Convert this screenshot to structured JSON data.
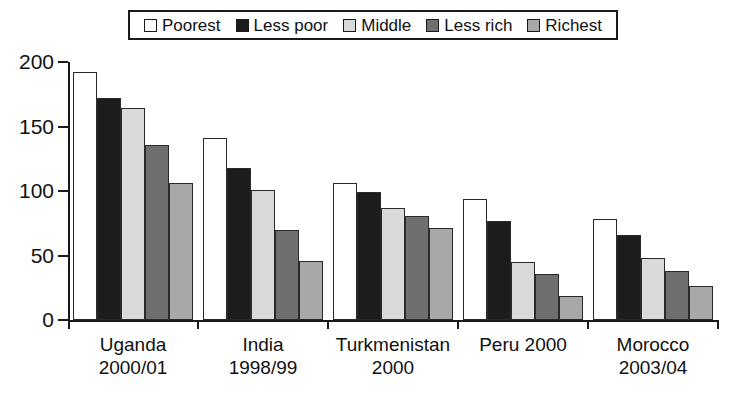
{
  "chart_data": {
    "type": "bar",
    "title": "",
    "subtitle": "",
    "xlabel": "",
    "ylabel": "",
    "ylim": [
      0,
      200
    ],
    "yticks": [
      0,
      50,
      100,
      150,
      200
    ],
    "ytick_labels": [
      "0",
      "50",
      "100",
      "150",
      "200"
    ],
    "grid": false,
    "legend_position": "top-center",
    "categories": [
      "Uganda 2000/01",
      "India 1998/99",
      "Turkmenistan 2000",
      "Peru 2000",
      "Morocco 2003/04"
    ],
    "category_lines": [
      [
        "Uganda",
        "2000/01"
      ],
      [
        "India",
        "1998/99"
      ],
      [
        "Turkmenistan",
        "2000"
      ],
      [
        "Peru 2000",
        ""
      ],
      [
        "Morocco",
        "2003/04"
      ]
    ],
    "series": [
      {
        "name": "Poorest",
        "color": "#ffffff",
        "values": [
          192,
          141,
          106,
          94,
          78
        ]
      },
      {
        "name": "Less poor",
        "color": "#1c1c1c",
        "values": [
          172,
          118,
          99,
          77,
          66
        ]
      },
      {
        "name": "Middle",
        "color": "#d9d9d9",
        "values": [
          164,
          101,
          87,
          45,
          48
        ]
      },
      {
        "name": "Less rich",
        "color": "#6f6f6f",
        "values": [
          136,
          70,
          81,
          36,
          38
        ]
      },
      {
        "name": "Richest",
        "color": "#a8a8a8",
        "values": [
          106,
          46,
          71,
          19,
          26
        ]
      }
    ]
  },
  "legend": {
    "entries": [
      {
        "label": "Poorest",
        "color": "#ffffff"
      },
      {
        "label": "Less poor",
        "color": "#1c1c1c"
      },
      {
        "label": "Middle",
        "color": "#d9d9d9"
      },
      {
        "label": "Less rich",
        "color": "#6f6f6f"
      },
      {
        "label": "Richest",
        "color": "#a8a8a8"
      }
    ]
  },
  "axes": {
    "border_color": "#1a1a1a",
    "bar_outline_color": "#2a2a2a"
  }
}
